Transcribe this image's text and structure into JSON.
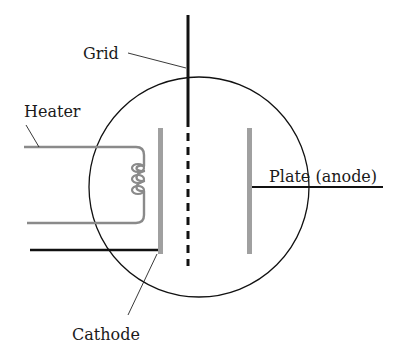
{
  "diagram": {
    "labels": {
      "grid": "Grid",
      "heater": "Heater",
      "plate": "Plate (anode)",
      "cathode": "Cathode"
    },
    "colors": {
      "line": "#111111",
      "electrode": "#9a9a9a",
      "heater_wire": "#8a8a8a",
      "background": "#ffffff"
    },
    "components": [
      {
        "name": "envelope",
        "shape": "circle"
      },
      {
        "name": "grid",
        "shape": "dashed vertical line with solid lead"
      },
      {
        "name": "cathode",
        "shape": "gray vertical bar"
      },
      {
        "name": "plate",
        "shape": "gray vertical bar"
      },
      {
        "name": "heater",
        "shape": "coil with two leads"
      }
    ]
  }
}
